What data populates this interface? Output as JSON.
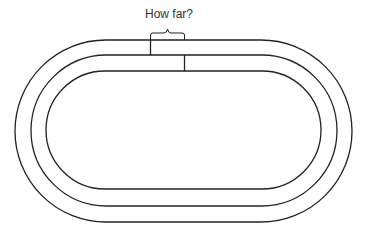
{
  "diagram": {
    "question_label": "How far?",
    "stroke_color": "#222222",
    "tracks": [
      {
        "name": "outer",
        "left": 15,
        "top": 40,
        "right": 352,
        "bottom": 222
      },
      {
        "name": "middle",
        "left": 31,
        "top": 55,
        "right": 337,
        "bottom": 206
      },
      {
        "name": "inner",
        "left": 46,
        "top": 71,
        "right": 321,
        "bottom": 189
      }
    ]
  }
}
